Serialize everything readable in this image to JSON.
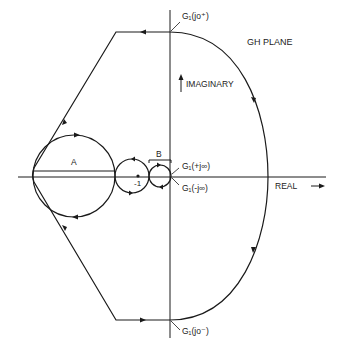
{
  "diagram": {
    "title": "GH PLANE",
    "axis_imaginary_label": "IMAGINARY",
    "axis_real_label": "REAL",
    "point_minus_one": "-1",
    "label_A": "A",
    "label_B": "B",
    "label_g_jo_plus": "G₁(jo⁺)",
    "label_g_jo_minus": "G₁(jo⁻)",
    "label_g_plus_jinf": "G₁(+j∞)",
    "label_g_minus_jinf": "G₁(-j∞)",
    "colors": {
      "stroke": "#1a1a1a",
      "background": "#ffffff"
    }
  }
}
